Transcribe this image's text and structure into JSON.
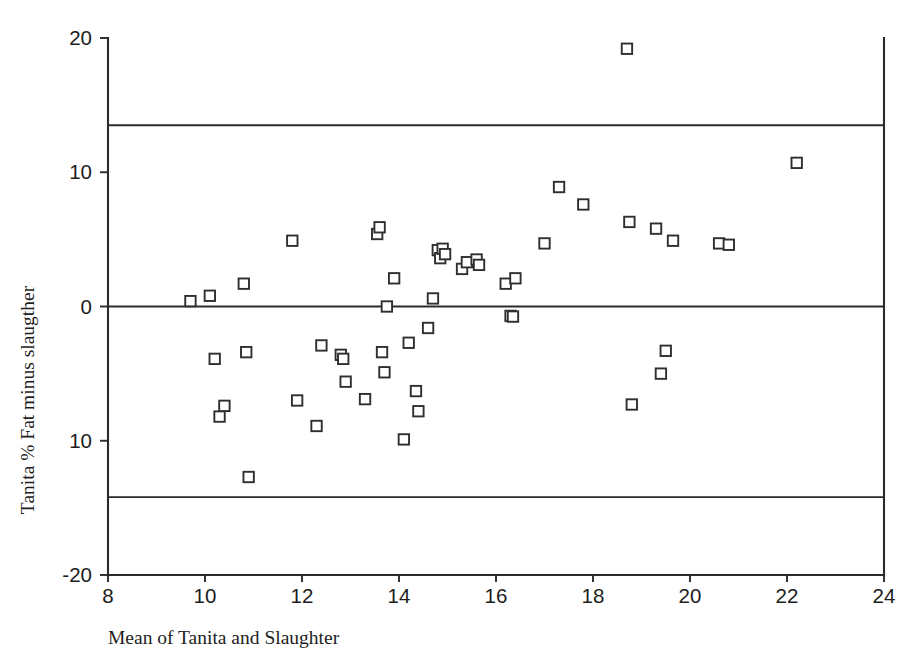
{
  "chart_data": {
    "type": "scatter",
    "title": "",
    "xlabel": "Mean of Tanita and Slaughter",
    "ylabel": "Tanita % Fat minus slaugther",
    "xlim": [
      8,
      24
    ],
    "ylim": [
      -20,
      20
    ],
    "xticks": [
      8,
      10,
      12,
      14,
      16,
      18,
      20,
      22,
      24
    ],
    "xticklabels": [
      "8",
      "10",
      "12",
      "14",
      "16",
      "18",
      "20",
      "22",
      "24"
    ],
    "yticks": [
      20,
      10,
      0,
      -10,
      -20
    ],
    "yticklabels": [
      "20",
      "10",
      "0",
      "10",
      "-20"
    ],
    "grid": false,
    "legend": null,
    "marker": "open-square",
    "reference_lines": [
      {
        "name": "upper-limit-of-agreement",
        "y": 13.5,
        "style": "solid"
      },
      {
        "name": "mean-difference-zero",
        "y": 0.0,
        "style": "solid"
      },
      {
        "name": "lower-limit-of-agreement",
        "y": -14.2,
        "style": "solid"
      }
    ],
    "x": [
      9.7,
      10.1,
      10.2,
      10.3,
      10.4,
      10.8,
      10.85,
      10.9,
      11.8,
      11.9,
      12.3,
      12.4,
      12.8,
      12.85,
      12.9,
      13.3,
      13.55,
      13.6,
      13.65,
      13.7,
      13.75,
      13.9,
      14.1,
      14.2,
      14.35,
      14.4,
      14.6,
      14.7,
      14.8,
      14.85,
      14.9,
      14.95,
      15.3,
      15.4,
      15.6,
      15.65,
      16.2,
      16.3,
      16.35,
      16.4,
      17.0,
      17.3,
      17.8,
      18.7,
      18.75,
      18.8,
      19.3,
      19.4,
      19.5,
      19.65,
      20.6,
      20.8,
      22.2
    ],
    "y": [
      0.4,
      0.8,
      -3.9,
      -8.2,
      -7.4,
      1.7,
      -3.4,
      -12.7,
      4.9,
      -7.0,
      -8.9,
      -2.9,
      -3.6,
      -3.9,
      -5.6,
      -6.9,
      5.4,
      5.9,
      -3.4,
      -4.9,
      0.0,
      2.1,
      -9.9,
      -2.7,
      -6.3,
      -7.8,
      -1.6,
      0.6,
      4.2,
      3.6,
      4.3,
      3.9,
      2.8,
      3.3,
      3.5,
      3.1,
      1.7,
      -0.7,
      -0.75,
      2.1,
      4.7,
      8.9,
      7.6,
      19.2,
      6.3,
      -7.3,
      5.8,
      -5.0,
      -3.3,
      4.9,
      4.7,
      4.6,
      10.7
    ]
  },
  "axes": {
    "x_axis_name": "x-axis",
    "y_axis_name": "y-axis"
  }
}
